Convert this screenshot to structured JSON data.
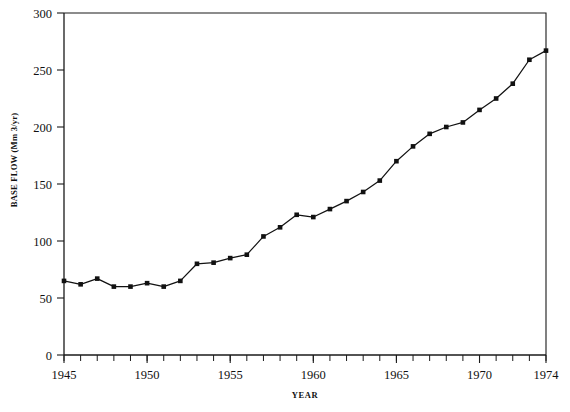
{
  "chart_data": {
    "type": "line",
    "title": "",
    "xlabel": "YEAR",
    "ylabel": "BASE FLOW (Mm 3/yr)",
    "xlim": [
      1945,
      1974
    ],
    "ylim": [
      0,
      300
    ],
    "grid": false,
    "legend": null,
    "marker": "filled-square",
    "x": [
      1945,
      1946,
      1947,
      1948,
      1949,
      1950,
      1951,
      1952,
      1953,
      1954,
      1955,
      1956,
      1957,
      1958,
      1959,
      1960,
      1961,
      1962,
      1963,
      1964,
      1965,
      1966,
      1967,
      1968,
      1969,
      1970,
      1971,
      1972,
      1973,
      1974
    ],
    "values": [
      65,
      62,
      67,
      60,
      60,
      63,
      60,
      65,
      80,
      81,
      85,
      88,
      104,
      112,
      123,
      121,
      128,
      135,
      143,
      153,
      170,
      183,
      194,
      200,
      204,
      215,
      225,
      238,
      259,
      267
    ],
    "series": [
      {
        "name": "Base flow",
        "values": [
          65,
          62,
          67,
          60,
          60,
          63,
          60,
          65,
          80,
          81,
          85,
          88,
          104,
          112,
          123,
          121,
          128,
          135,
          143,
          153,
          170,
          183,
          194,
          200,
          204,
          215,
          225,
          238,
          259,
          267
        ]
      }
    ],
    "x_tick_labels": [
      "1945",
      "1950",
      "1955",
      "1960",
      "1965",
      "1970",
      "1974"
    ],
    "x_tick_values": [
      1945,
      1950,
      1955,
      1960,
      1965,
      1970,
      1974
    ],
    "x_minor_tick_step": 1,
    "y_tick_labels": [
      "0",
      "50",
      "100",
      "150",
      "200",
      "250",
      "300"
    ],
    "y_tick_values": [
      0,
      50,
      100,
      150,
      200,
      250,
      300
    ],
    "colors": {
      "line": "#121212",
      "marker": "#111111",
      "axis": "#1a1a1a",
      "background": "#ffffff"
    }
  }
}
